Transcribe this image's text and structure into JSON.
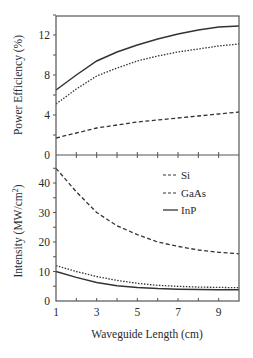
{
  "chart_data": [
    {
      "type": "line",
      "title": "",
      "xlabel": "",
      "ylabel": "Power Efficiency (%)",
      "x": [
        1,
        2,
        3,
        4,
        5,
        6,
        7,
        8,
        9,
        10
      ],
      "xlim": [
        1,
        10
      ],
      "ylim": [
        0,
        14
      ],
      "yticks": [
        0,
        4,
        8,
        12
      ],
      "grid": false,
      "series": [
        {
          "name": "Si",
          "style": "dashed",
          "values": [
            1.7,
            2.2,
            2.7,
            3.0,
            3.3,
            3.5,
            3.7,
            3.9,
            4.1,
            4.3
          ]
        },
        {
          "name": "GaAs",
          "style": "dotted",
          "values": [
            5.1,
            6.6,
            7.9,
            8.7,
            9.4,
            9.9,
            10.3,
            10.6,
            10.9,
            11.1
          ]
        },
        {
          "name": "InP",
          "style": "solid",
          "values": [
            6.5,
            8.0,
            9.4,
            10.3,
            11.0,
            11.6,
            12.1,
            12.5,
            12.8,
            12.9
          ]
        }
      ]
    },
    {
      "type": "line",
      "title": "",
      "xlabel": "Waveguide Length (cm)",
      "ylabel": "Intensity (MW/cm²)",
      "x": [
        1,
        2,
        3,
        4,
        5,
        6,
        7,
        8,
        9,
        10
      ],
      "xlim": [
        1,
        10
      ],
      "xticks": [
        1,
        3,
        5,
        7,
        9
      ],
      "ylim": [
        0,
        48
      ],
      "yticks": [
        0,
        10,
        20,
        30,
        40
      ],
      "grid": false,
      "legend_position": "upper right",
      "series": [
        {
          "name": "Si",
          "style": "dashed",
          "values": [
            45,
            37,
            30,
            25.5,
            22.5,
            20,
            18.5,
            17.3,
            16.5,
            16
          ]
        },
        {
          "name": "GaAs",
          "style": "dotted",
          "values": [
            12,
            10,
            8.3,
            7,
            6,
            5.3,
            5,
            4.7,
            4.6,
            4.5
          ]
        },
        {
          "name": "InP",
          "style": "solid",
          "values": [
            10,
            8,
            6.3,
            5.2,
            4.6,
            4.2,
            4,
            3.9,
            3.8,
            3.8
          ]
        }
      ]
    }
  ],
  "labels": {
    "top_ylabel": "Power Efficiency (%)",
    "bottom_ylabel_main": "Intensity (MW/cm",
    "bottom_ylabel_sup": "2",
    "bottom_ylabel_close": ")",
    "xlabel": "Waveguide Length (cm)",
    "top_yticks": [
      "0",
      "4",
      "8",
      "12"
    ],
    "bottom_yticks": [
      "0",
      "10",
      "20",
      "30",
      "40"
    ],
    "xticks": [
      "1",
      "3",
      "5",
      "7",
      "9"
    ],
    "legend": [
      "Si",
      "GaAs",
      "InP"
    ]
  }
}
